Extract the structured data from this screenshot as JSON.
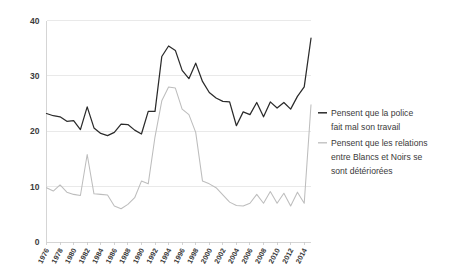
{
  "chart_data": {
    "type": "line",
    "title": "",
    "subtitle": "",
    "xlabel": "",
    "ylabel": "",
    "xlim": [
      1976,
      2015
    ],
    "ylim": [
      0,
      40
    ],
    "grid": true,
    "legend_position": "right",
    "y_ticks": [
      "0",
      "10",
      "20",
      "30",
      "40"
    ],
    "y_tick_values": [
      0,
      10,
      20,
      30,
      40
    ],
    "x_ticks": [
      "1976",
      "1978",
      "1980",
      "1982",
      "1984",
      "1986",
      "1988",
      "1990",
      "1992",
      "1994",
      "1996",
      "1998",
      "2000",
      "2002",
      "2004",
      "2006",
      "2008",
      "2010",
      "2012",
      "2014"
    ],
    "x": [
      1976,
      1977,
      1978,
      1979,
      1980,
      1981,
      1982,
      1983,
      1984,
      1985,
      1986,
      1987,
      1988,
      1989,
      1990,
      1991,
      1992,
      1993,
      1994,
      1995,
      1996,
      1997,
      1998,
      1999,
      2000,
      2001,
      2002,
      2003,
      2004,
      2005,
      2006,
      2007,
      2008,
      2009,
      2010,
      2011,
      2012,
      2013,
      2014,
      2015
    ],
    "series": [
      {
        "name": "Pensent que la police fait mal son travail",
        "color": "#2b2b2b",
        "values": [
          23.2,
          22.8,
          22.6,
          21.8,
          21.9,
          20.3,
          24.4,
          20.6,
          19.6,
          19.2,
          19.8,
          21.3,
          21.2,
          20.2,
          19.5,
          23.6,
          23.6,
          33.5,
          35.4,
          34.6,
          31.0,
          29.5,
          32.3,
          29.0,
          27.0,
          26.0,
          25.4,
          25.3,
          21.0,
          23.5,
          23.0,
          25.2,
          22.6,
          25.3,
          24.2,
          25.2,
          24.0,
          26.3,
          28.0,
          36.8
        ]
      },
      {
        "name": "Pensent que les relations entre Blancs et Noirs se sont détériorées",
        "color": "#bdbdbd",
        "values": [
          9.8,
          9.2,
          10.3,
          9.0,
          8.6,
          8.4,
          15.8,
          8.7,
          8.6,
          8.5,
          6.5,
          6.0,
          6.8,
          8.0,
          11.0,
          10.5,
          19.0,
          25.5,
          28.0,
          27.8,
          24.0,
          23.0,
          19.8,
          11.0,
          10.5,
          9.8,
          8.5,
          7.2,
          6.6,
          6.5,
          7.0,
          8.6,
          7.0,
          9.1,
          7.0,
          8.8,
          6.5,
          9.0,
          7.0,
          24.8
        ]
      }
    ]
  },
  "legend": {
    "items": [
      {
        "label_line1": "Pensent que la police",
        "label_line2": "fait mal son travail",
        "label_line3": "",
        "color": "#2b2b2b"
      },
      {
        "label_line1": "Pensent que les relations",
        "label_line2": "entre Blancs et Noirs se",
        "label_line3": "sont détériorées",
        "color": "#bdbdbd"
      }
    ]
  }
}
